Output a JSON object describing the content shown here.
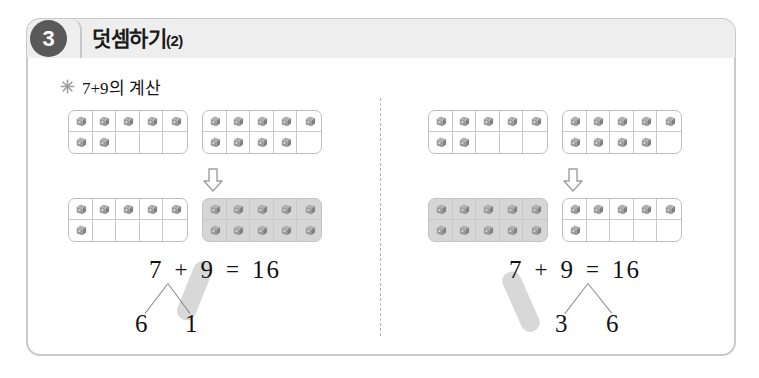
{
  "card": {
    "badge_number": "3",
    "title_main": "덧셈하기",
    "title_suffix": "(2)",
    "subtitle": "7+9의 계산",
    "star_icon": "star-bullet-icon"
  },
  "icons": {
    "cube": "cube-counter-icon",
    "down_arrow": "down-arrow-icon",
    "divider": "vertical-dashed-divider"
  },
  "colors": {
    "card_border": "#c9c9c9",
    "header_band": "#eeeeee",
    "badge_bg": "#595959",
    "highlight_gray": "#d6d6d6",
    "bar_gray": "#d8d8d8",
    "cube_gray": "#8e8e8e",
    "text": "#111111"
  },
  "panels": [
    {
      "name": "left-method",
      "before": {
        "frames": [
          {
            "name": "frame-a",
            "filled": 7,
            "highlight": false
          },
          {
            "name": "frame-b",
            "filled": 9,
            "highlight": false
          }
        ]
      },
      "arrow": "⇩",
      "after": {
        "frames": [
          {
            "name": "frame-a",
            "filled": 6,
            "highlight": false
          },
          {
            "name": "frame-b",
            "filled": 10,
            "highlight": true
          }
        ]
      },
      "equation": {
        "addend1": "7",
        "operator": "+",
        "addend2": "9",
        "equals": "=",
        "result": "16",
        "decomposed_from": "addend1",
        "part_left": "6",
        "part_right": "1",
        "highlight_targets": "part_right-to-addend2"
      }
    },
    {
      "name": "right-method",
      "before": {
        "frames": [
          {
            "name": "frame-a",
            "filled": 7,
            "highlight": false
          },
          {
            "name": "frame-b",
            "filled": 9,
            "highlight": false
          }
        ]
      },
      "arrow": "⇩",
      "after": {
        "frames": [
          {
            "name": "frame-a",
            "filled": 10,
            "highlight": true
          },
          {
            "name": "frame-b",
            "filled": 6,
            "highlight": false
          }
        ]
      },
      "equation": {
        "addend1": "7",
        "operator": "+",
        "addend2": "9",
        "equals": "=",
        "result": "16",
        "decomposed_from": "addend2",
        "part_left": "3",
        "part_right": "6",
        "highlight_targets": "addend1-to-part_left"
      }
    }
  ]
}
